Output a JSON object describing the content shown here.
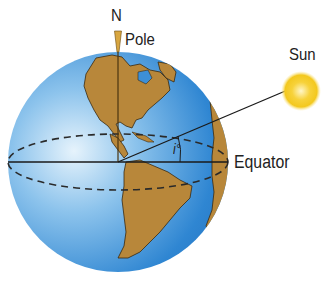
{
  "labels": {
    "north": "N",
    "pole": "Pole",
    "sun": "Sun",
    "equator": "Equator",
    "angle": "i°"
  },
  "colors": {
    "ocean": "#3d8fd6",
    "ocean_highlight": "#d8ecfa",
    "land": "#b8873a",
    "land_outline": "#3a2a10",
    "sun": "#f5cf2a",
    "line": "#1a1a1a"
  }
}
